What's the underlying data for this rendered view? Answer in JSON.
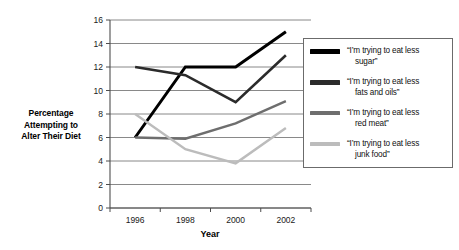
{
  "chart_data": {
    "type": "line",
    "title": "",
    "xlabel": "Year",
    "ylabel": "Percentage Attempting to Alter Their Diet",
    "x": [
      1996,
      1998,
      2000,
      2002
    ],
    "xtick_labels": [
      "1996",
      "1998",
      "2000",
      "2002"
    ],
    "ytick_labels": [
      "0",
      "2",
      "4",
      "6",
      "8",
      "10",
      "12",
      "14",
      "16"
    ],
    "yticks": [
      0,
      2,
      4,
      6,
      8,
      10,
      12,
      14,
      16
    ],
    "ylim": [
      0,
      16
    ],
    "grid": "horizontal",
    "legend_position": "right",
    "series": [
      {
        "name": "“I’m trying to eat less sugar”",
        "label_line1": "“I’m trying to eat less",
        "label_line2": "sugar”",
        "color": "#000000",
        "values": [
          6,
          12,
          12,
          15
        ]
      },
      {
        "name": "“I’m trying to eat less fats and oils”",
        "label_line1": "“I’m trying to eat less",
        "label_line2": "fats and oils”",
        "color": "#2b2b2b",
        "values": [
          12,
          11.3,
          9,
          13
        ]
      },
      {
        "name": "“I’m trying to eat less red meat”",
        "label_line1": "“I’m trying to eat less",
        "label_line2": "red meat”",
        "color": "#6e6e6e",
        "values": [
          6,
          5.9,
          7.2,
          9.1
        ]
      },
      {
        "name": "“I’m trying to eat less junk food”",
        "label_line1": "“I’m trying to eat less",
        "label_line2": "junk food”",
        "color": "#bcbcbc",
        "values": [
          8,
          5,
          3.8,
          6.8
        ]
      }
    ]
  },
  "axis": {
    "y_title_line1": "Percentage",
    "y_title_line2": "Attempting to",
    "y_title_line3": "Alter Their Diet",
    "x_title": "Year"
  },
  "colors": {
    "axis": "#4d4d4d",
    "grid": "#6b6b6b",
    "legend_border": "#6b6b6b",
    "background": "#ffffff"
  }
}
